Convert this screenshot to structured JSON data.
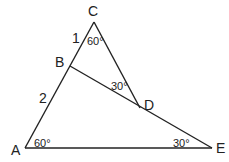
{
  "figure": {
    "vertices": {
      "A": {
        "label": "A",
        "x": 25,
        "y": 148
      },
      "B": {
        "label": "B",
        "x": 70,
        "y": 66
      },
      "C": {
        "label": "C",
        "x": 94,
        "y": 22
      },
      "D": {
        "label": "D",
        "x": 140,
        "y": 108
      },
      "E": {
        "label": "E",
        "x": 212,
        "y": 148
      }
    },
    "segments": [
      {
        "from": "A",
        "to": "C"
      },
      {
        "from": "C",
        "to": "D"
      },
      {
        "from": "B",
        "to": "E"
      },
      {
        "from": "A",
        "to": "E"
      }
    ],
    "side_labels": {
      "CB": "1",
      "BA": "2"
    },
    "angle_labels": {
      "C": "60°",
      "BDC": "30°",
      "A": "60°",
      "E": "30°"
    },
    "stroke_color": "#222222"
  }
}
